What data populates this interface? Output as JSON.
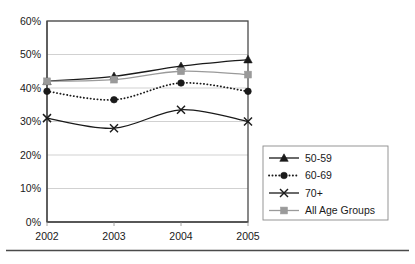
{
  "chart_data": {
    "type": "line",
    "title": "",
    "subtitle": "",
    "xlabel": "",
    "ylabel": "",
    "categories": [
      "2002",
      "2003",
      "2004",
      "2005"
    ],
    "x_tick_labels": [
      "2002",
      "2003",
      "2004",
      "2005"
    ],
    "y_tick_labels": [
      "0%",
      "10%",
      "20%",
      "30%",
      "40%",
      "50%",
      "60%"
    ],
    "y_tick_values": [
      0,
      10,
      20,
      30,
      40,
      50,
      60
    ],
    "ylim": [
      0,
      60
    ],
    "y_unit": "%",
    "grid": "horizontal",
    "legend_position": "right-lower",
    "series": [
      {
        "name": "50-59",
        "marker": "triangle",
        "line_style": "solid",
        "color": "#1a1a1a",
        "values": [
          42.0,
          43.5,
          46.5,
          48.5
        ]
      },
      {
        "name": "60-69",
        "marker": "circle",
        "line_style": "dotted",
        "color": "#1a1a1a",
        "values": [
          39.0,
          36.5,
          41.5,
          39.0
        ]
      },
      {
        "name": "70+",
        "marker": "x",
        "line_style": "solid",
        "color": "#1a1a1a",
        "values": [
          31.0,
          28.0,
          33.5,
          30.0
        ]
      },
      {
        "name": "All Age Groups",
        "marker": "square",
        "line_style": "solid",
        "color": "#9a9a9a",
        "values": [
          42.0,
          42.5,
          45.0,
          44.0
        ]
      }
    ]
  },
  "legend": {
    "entries": [
      {
        "label": "50-59"
      },
      {
        "label": "60-69"
      },
      {
        "label": "70+"
      },
      {
        "label": "All Age Groups"
      }
    ]
  },
  "colors": {
    "axis": "#4a4a4a",
    "grid": "#bdbdbd",
    "series_dark": "#1a1a1a",
    "series_gray": "#9a9a9a",
    "background": "#ffffff"
  }
}
